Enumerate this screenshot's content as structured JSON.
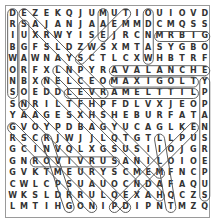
{
  "puzzle": {
    "rows": [
      "DEZEKQJUMUTIOUIOVD",
      "RSAJANJAAEMMDCMQSS",
      "IUXRWYISEJRCNMRBIG",
      "BGFSLDZWSXMTASYGBO",
      "WAWNAYSCTLCXWHBTRF",
      "ORFXLNPYRAVALANCHE",
      "NBXNELCEOMAXIGOLTY",
      "SOEDDLEVRAMELTTILP",
      "SNRILTFHPFDLVXJEOP",
      "YAAGESXHSHEBURFATA",
      "GVOYPDBAGYUCAGLKEN",
      "RSCRJWJJLQTGTLLPUS",
      "GCINVQLXGSUSIIOJGR",
      "GNROVIVRUSANILOIOE",
      "GVKTMEURYSCMEMFNCP",
      "CWLCPSUAUOCNDAFAQU",
      "WKSLDRRULQEXAHQCZS",
      "LMTIHGONIPDIPNTMZQ"
    ],
    "found_words": [
      {
        "text": "MRBIG",
        "r1": 3,
        "c1": 14,
        "r2": 3,
        "c2": 18
      },
      {
        "text": "AVALANCHE",
        "r1": 6,
        "c1": 10,
        "r2": 6,
        "c2": 18
      },
      {
        "text": "MAXIGOLT",
        "r1": 7,
        "c1": 10,
        "r2": 7,
        "c2": 17
      },
      {
        "text": "LEVRAMELTTIL",
        "r1": 8,
        "c1": 6,
        "r2": 8,
        "c2": 17
      },
      {
        "text": "ROVIVRUS",
        "r1": 14,
        "c1": 3,
        "r2": 14,
        "c2": 10
      },
      {
        "text": "DRIBWONS",
        "r1": 1,
        "c1": 1,
        "r2": 8,
        "c2": 1
      },
      {
        "text": "SUGARBON",
        "r1": 2,
        "c1": 2,
        "r2": 9,
        "c2": 2
      },
      {
        "text": "ODNAW",
        "r1": 1,
        "c1": 13,
        "r2": 5,
        "c2": 13
      },
      {
        "text": "MAE",
        "r1": 1,
        "c1": 9,
        "r2": 3,
        "c2": 9
      },
      {
        "text": "YPPANSREPUS",
        "r1": 7,
        "c1": 18,
        "r2": 17,
        "c2": 18
      },
      {
        "text": "diag1",
        "r1": 1,
        "c1": 2,
        "r2": 8,
        "c2": 9
      },
      {
        "text": "diag2",
        "r1": 1,
        "c1": 11,
        "r2": 5,
        "c2": 7
      },
      {
        "text": "diag3",
        "r1": 6,
        "c1": 5,
        "r2": 15,
        "c2": 14
      },
      {
        "text": "diag4",
        "r1": 7,
        "c1": 4,
        "r2": 17,
        "c2": 14
      },
      {
        "text": "diag5",
        "r1": 9,
        "c1": 2,
        "r2": 18,
        "c2": 11
      },
      {
        "text": "diag6",
        "r1": 11,
        "c1": 1,
        "r2": 18,
        "c2": 8
      },
      {
        "text": "diag7",
        "r1": 11,
        "c1": 17,
        "r2": 18,
        "c2": 10
      },
      {
        "text": "diag8",
        "r1": 12,
        "c1": 4,
        "r2": 18,
        "c2": 6
      },
      {
        "text": "diag9",
        "r1": 12,
        "c1": 14,
        "r2": 18,
        "c2": 15
      }
    ],
    "colors": {
      "text": "#333333",
      "outline": "#555555",
      "border": "#9a9a9a"
    }
  }
}
